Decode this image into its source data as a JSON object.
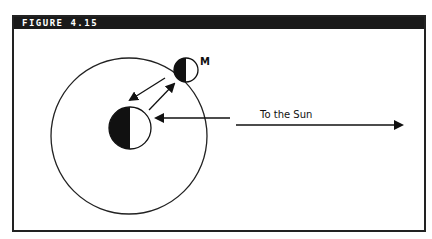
{
  "figure": {
    "title": "FIGURE 4.15",
    "moon_label": "M",
    "sun_label": "To the Sun"
  },
  "colors": {
    "ink": "#111111",
    "header_bg": "#1a1a1a",
    "background": "#ffffff"
  }
}
